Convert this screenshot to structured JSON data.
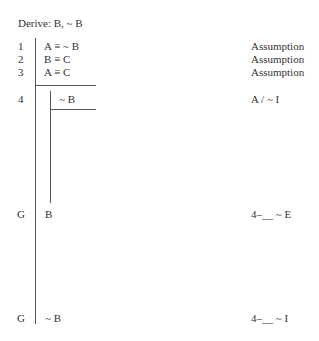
{
  "header": {
    "derive": "Derive: B, ~ B"
  },
  "lines": [
    {
      "num": "1",
      "formula": "A ≡ ~ B",
      "justification": "Assumption"
    },
    {
      "num": "2",
      "formula": "B ≡ C",
      "justification": "Assumption"
    },
    {
      "num": "3",
      "formula": "A ≡ C",
      "justification": "Assumption"
    },
    {
      "num": "4",
      "formula": "~ B",
      "justification": "A / ~ I"
    },
    {
      "num": "G",
      "formula": "B",
      "justification": "4–__ ~ E"
    },
    {
      "num": "G",
      "formula": "~ B",
      "justification": "4–__ ~ I"
    }
  ]
}
